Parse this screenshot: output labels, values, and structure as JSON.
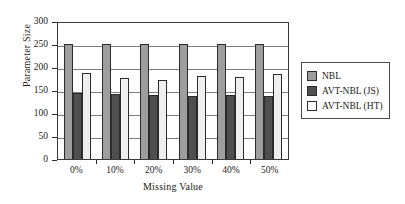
{
  "chart_data": {
    "type": "bar",
    "title": "",
    "xlabel": "Missing Value",
    "ylabel": "Parameter Size",
    "categories": [
      "0%",
      "10%",
      "20%",
      "30%",
      "40%",
      "50%"
    ],
    "series": [
      {
        "name": "NBL",
        "color": "#9e9e9e",
        "values": [
          250,
          250,
          250,
          250,
          250,
          250
        ]
      },
      {
        "name": "AVT-NBL (JS)",
        "color": "#4f4f4f",
        "values": [
          143,
          142,
          139,
          138,
          140,
          136
        ]
      },
      {
        "name": "AVT-NBL (HT)",
        "color": "#ffffff",
        "values": [
          188,
          176,
          172,
          181,
          178,
          185
        ]
      }
    ],
    "ylim": [
      0,
      300
    ],
    "yticks": [
      0,
      50,
      100,
      150,
      200,
      250,
      300
    ],
    "ytick_labels": [
      "0",
      "50",
      "100",
      "150",
      "200",
      "250",
      "300"
    ],
    "grid": true,
    "legend_position": "right"
  },
  "legend": {
    "entries": [
      {
        "label": "NBL"
      },
      {
        "label": "AVT-NBL (JS)"
      },
      {
        "label": "AVT-NBL (HT)"
      }
    ]
  }
}
